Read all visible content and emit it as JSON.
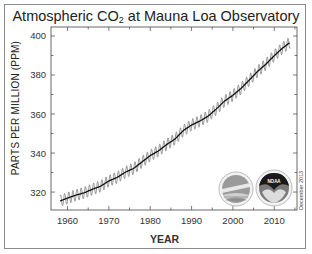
{
  "chart_data": {
    "type": "line",
    "title": "Atmospheric CO2 at Mauna Loa Observatory",
    "title_main": "Atmospheric CO",
    "title_sub": "2",
    "title_rest": " at Mauna Loa Observatory",
    "xlabel": "YEAR",
    "ylabel": "PARTS PER MILLION  (PPM)",
    "xlim": [
      1956,
      2015.5
    ],
    "ylim": [
      310.8,
      404.6
    ],
    "x_ticks": [
      1960,
      1970,
      1980,
      1990,
      2000,
      2010
    ],
    "x_tick_labels": [
      "1960",
      "1970",
      "1980",
      "1990",
      "2000",
      "2010"
    ],
    "y_ticks": [
      320,
      340,
      360,
      380,
      400
    ],
    "y_tick_labels": [
      "320",
      "340",
      "360",
      "380",
      "400"
    ],
    "grid": false,
    "legend": null,
    "annotation": "December 2013",
    "series": [
      {
        "name": "Monthly mean CO2 (seasonal cycle)",
        "style": "thin grey oscillating line",
        "color": "#8c8c8c",
        "seasonal_amplitude_ppm": 3
      },
      {
        "name": "Seasonally corrected trend",
        "style": "black line",
        "color": "#111111",
        "x": [
          1958,
          1960,
          1962,
          1964,
          1966,
          1968,
          1970,
          1972,
          1974,
          1976,
          1978,
          1980,
          1982,
          1984,
          1986,
          1988,
          1990,
          1992,
          1994,
          1996,
          1998,
          2000,
          2002,
          2004,
          2006,
          2008,
          2010,
          2012,
          2013.9
        ],
        "values": [
          315.3,
          316.9,
          318.4,
          319.6,
          321.4,
          323.0,
          325.7,
          327.5,
          330.2,
          332.1,
          335.4,
          338.7,
          341.1,
          344.4,
          347.2,
          351.5,
          354.4,
          356.4,
          358.9,
          362.6,
          366.7,
          369.6,
          373.2,
          377.5,
          381.9,
          385.6,
          389.9,
          393.8,
          396.8
        ]
      }
    ]
  },
  "logos": [
    {
      "name": "scripps-logo",
      "label": "Scripps Institution of Oceanography seal"
    },
    {
      "name": "noaa-logo",
      "label": "NOAA"
    }
  ]
}
